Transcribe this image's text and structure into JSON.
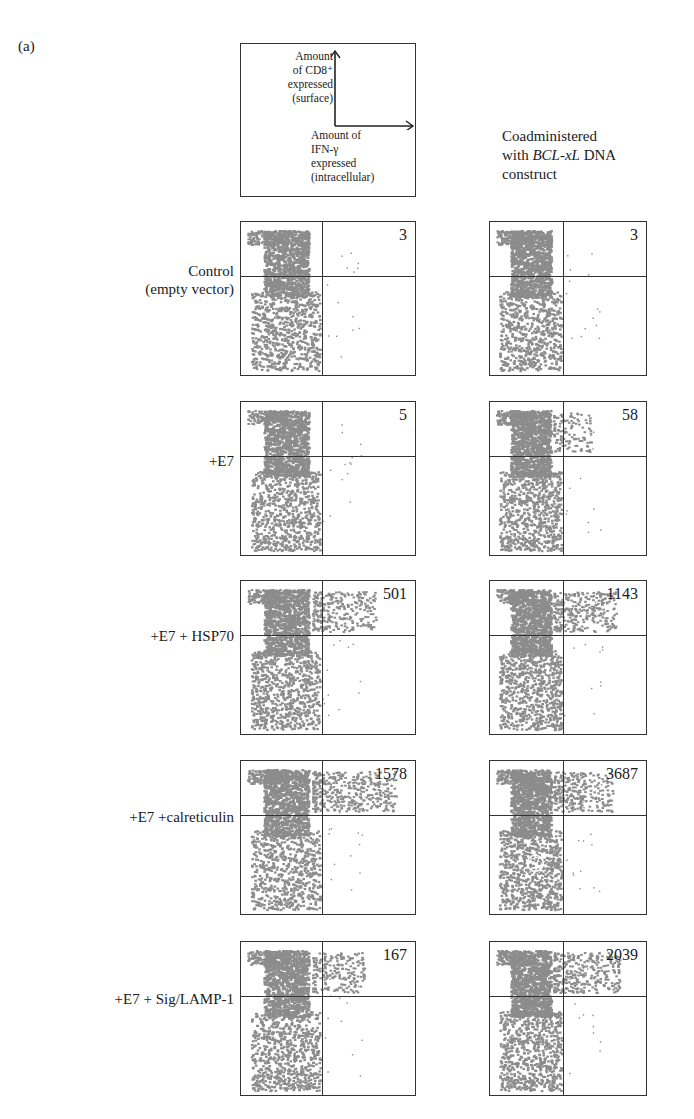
{
  "figure": {
    "panel_label": "(a)",
    "legend": {
      "y_axis_lines": [
        "Amount",
        "of CD8⁺",
        "expressed",
        "(surface)"
      ],
      "x_axis_lines": [
        "Amount of",
        "IFN-γ",
        "expressed",
        "(intracellular)"
      ]
    },
    "column_header": {
      "line1": "Coadministered",
      "line2_prefix": "with ",
      "line2_italic": "BCL-xL",
      "line2_suffix": " DNA",
      "line3": "construct"
    },
    "rows": [
      {
        "label_lines": [
          "Control",
          "(empty vector)"
        ],
        "left_count": "3",
        "right_count": "3"
      },
      {
        "label_lines": [
          "+E7"
        ],
        "left_count": "5",
        "right_count": "58"
      },
      {
        "label_lines": [
          "+E7 + HSP70"
        ],
        "left_count": "501",
        "right_count": "1143"
      },
      {
        "label_lines": [
          "+E7 +calreticulin"
        ],
        "left_count": "1578",
        "right_count": "3687"
      },
      {
        "label_lines": [
          "+E7 + Sig/LAMP-1"
        ],
        "left_count": "167",
        "right_count": "2039"
      }
    ]
  },
  "chart_data": {
    "type": "scatter",
    "xlabel": "Amount of IFN-γ expressed (intracellular)",
    "ylabel": "Amount of CD8+ expressed (surface)",
    "categories": [
      "Control (empty vector)",
      "+E7",
      "+E7 + HSP70",
      "+E7 +calreticulin",
      "+E7 + Sig/LAMP-1"
    ],
    "series": [
      {
        "name": "Without BCL-xL",
        "values": [
          3,
          5,
          501,
          1578,
          167
        ]
      },
      {
        "name": "Coadministered with BCL-xL DNA construct",
        "values": [
          3,
          58,
          1143,
          3687,
          2039
        ]
      }
    ],
    "annotation": "Upper-right quadrant counts (CD8+ IFN-γ+ cells)"
  },
  "colors": {
    "dots": "#8a8a8a",
    "lines": "#333333"
  }
}
